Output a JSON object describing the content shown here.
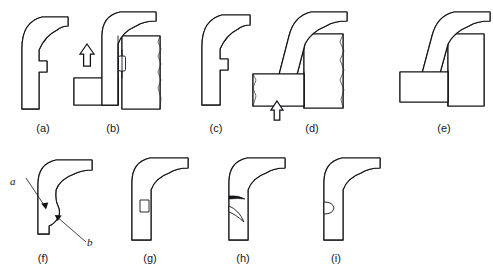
{
  "figure": {
    "background_color": "#ffffff",
    "line_color": "#141418",
    "hatch_color": "#1d1d22",
    "caption_font_size_px": 11
  },
  "top_row": {
    "label": "Forming sequence",
    "panels": [
      {
        "id": "a",
        "caption": "(a)",
        "description": "Hook-shaped flange cross-section, free state, section hatched at 45 degrees",
        "has_arrow": false,
        "arrow_direction": "",
        "has_die": false
      },
      {
        "id": "b",
        "caption": "(b)",
        "description": "Flange engaged between punch and lower die block with upward forming arrow",
        "has_arrow": true,
        "arrow_direction": "up",
        "has_die": true
      },
      {
        "id": "c",
        "caption": "(c)",
        "description": "Formed hook-shaped flange cross-section after withdrawal",
        "has_arrow": false,
        "arrow_direction": "",
        "has_die": false
      },
      {
        "id": "d",
        "caption": "(d)",
        "description": "Inclined flange pressed against die with upward forming arrow below",
        "has_arrow": true,
        "arrow_direction": "up",
        "has_die": true
      },
      {
        "id": "e",
        "caption": "(e)",
        "description": "Inclined flange fully seated against die block, no arrow",
        "has_arrow": false,
        "arrow_direction": "",
        "has_die": true
      }
    ]
  },
  "bottom_row": {
    "label": "Flange defect cross-sections",
    "panels": [
      {
        "id": "f",
        "caption": "(f)",
        "description": "Flange cross-section with surface callouts a and b at the inner bend region",
        "defect": "surface-marks",
        "callouts": [
          {
            "key": "b",
            "text": "b",
            "position": "upper-left"
          },
          {
            "key": "a",
            "text": "a",
            "position": "lower-right"
          }
        ]
      },
      {
        "id": "g",
        "caption": "(g)",
        "description": "Flange cross-section with small rectangular internal void in the vertical wall",
        "defect": "rectangular-void",
        "callouts": []
      },
      {
        "id": "h",
        "caption": "(h)",
        "description": "Flange cross-section with two crescent shaped cracks in the vertical wall",
        "defect": "cracks",
        "callouts": []
      },
      {
        "id": "i",
        "caption": "(i)",
        "description": "Flange cross-section with a small rounded void in the vertical wall",
        "defect": "rounded-void",
        "callouts": []
      }
    ]
  }
}
